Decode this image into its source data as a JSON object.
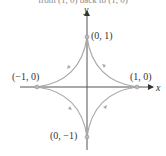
{
  "caption_fragment": "from (1, 0) back to (1, 0)",
  "axes": {
    "x_label": "x",
    "y_label": "y"
  },
  "points": [
    {
      "label": "(0, 1)",
      "x": 0,
      "y": 1
    },
    {
      "label": "(1, 0)",
      "x": 1,
      "y": 0
    },
    {
      "label": "(−1, 0)",
      "x": -1,
      "y": 0
    },
    {
      "label": "(0, −1)",
      "x": 0,
      "y": -1
    }
  ],
  "curve": {
    "name": "astroid",
    "equation": "x^(2/3) + y^(2/3) = 1",
    "orientation": "counterclockwise",
    "color": "#a8a8a8"
  },
  "colors": {
    "axis": "#555555",
    "curve": "#a8a8a8",
    "text": "#333333"
  }
}
